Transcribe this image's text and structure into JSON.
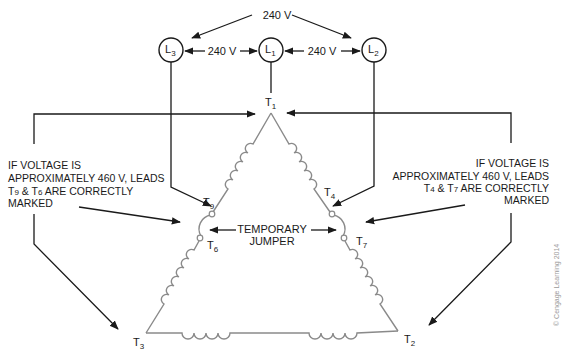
{
  "supply": {
    "top_voltage": "240 V",
    "left_voltage": "240 V",
    "right_voltage": "240 V",
    "lines": [
      {
        "id": "L3",
        "letter": "L",
        "sub": "3"
      },
      {
        "id": "L1",
        "letter": "L",
        "sub": "1"
      },
      {
        "id": "L2",
        "letter": "L",
        "sub": "2"
      }
    ]
  },
  "terminals": {
    "T1": {
      "letter": "T",
      "sub": "1"
    },
    "T2": {
      "letter": "T",
      "sub": "2"
    },
    "T3": {
      "letter": "T",
      "sub": "3"
    },
    "T4": {
      "letter": "T",
      "sub": "4"
    },
    "T6": {
      "letter": "T",
      "sub": "6"
    },
    "T7": {
      "letter": "T",
      "sub": "7"
    },
    "T9": {
      "letter": "T",
      "sub": "9"
    }
  },
  "jumper_label": {
    "line1": "TEMPORARY",
    "line2": "JUMPER"
  },
  "left_note": {
    "line1": "IF VOLTAGE IS",
    "line2": "APPROXIMATELY 460 V, LEADS",
    "line3_prefix": "T",
    "line3_sub1": "9",
    "line3_mid": " & T",
    "line3_sub2": "6",
    "line3_suffix": " ARE CORRECTLY",
    "line4": "MARKED"
  },
  "right_note": {
    "line1": "IF VOLTAGE IS",
    "line2": "APPROXIMATELY 460 V, LEADS",
    "line3_prefix": "T",
    "line3_sub1": "4",
    "line3_mid": " & T",
    "line3_sub2": "7",
    "line3_suffix": " ARE CORRECTLY",
    "line4": "MARKED"
  },
  "credit": "© Cengage Learning 2014",
  "colors": {
    "wire": "#1a1a1a",
    "winding": "#8a8a8a",
    "text": "#1a1a1a",
    "credit": "#9a9a9a"
  }
}
